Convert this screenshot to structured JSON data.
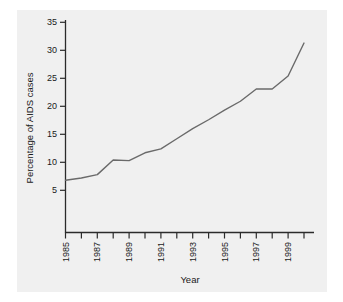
{
  "chart_data": {
    "type": "line",
    "title": "",
    "xlabel": "Year",
    "ylabel": "Percentage of AIDS cases",
    "x": [
      1985,
      1986,
      1987,
      1988,
      1989,
      1990,
      1991,
      1992,
      1993,
      1994,
      1995,
      1996,
      1997,
      1998,
      1999,
      2000
    ],
    "values": [
      6.8,
      7.2,
      7.8,
      10.4,
      10.3,
      11.7,
      12.4,
      14.2,
      16.0,
      17.6,
      19.3,
      20.9,
      23.1,
      23.1,
      25.4,
      31.3
    ],
    "series": [
      {
        "name": "Percentage of AIDS cases",
        "values": [
          6.8,
          7.2,
          7.8,
          10.4,
          10.3,
          11.7,
          12.4,
          14.2,
          16.0,
          17.6,
          19.3,
          20.9,
          23.1,
          23.1,
          25.4,
          31.3
        ]
      }
    ],
    "xlim": [
      1985,
      2000
    ],
    "ylim": [
      0,
      35
    ],
    "ytick_labels": [
      "5",
      "10",
      "15",
      "20",
      "25",
      "30",
      "35"
    ],
    "ytick_values": [
      5,
      10,
      15,
      20,
      25,
      30,
      35
    ],
    "xtick_values": [
      1985,
      1986,
      1987,
      1988,
      1989,
      1990,
      1991,
      1992,
      1993,
      1994,
      1995,
      1996,
      1997,
      1998,
      1999,
      2000
    ],
    "xtick_labels": [
      "1985",
      "",
      "1987",
      "",
      "1989",
      "",
      "1991",
      "",
      "1993",
      "",
      "1995",
      "",
      "1997",
      "",
      "1999",
      ""
    ],
    "grid": false,
    "legend": null,
    "line_color": "#6a6a6a",
    "axis_color": "#2b2b2b",
    "panel_color": "#f0f0f0",
    "figure_color": "#ffffff"
  }
}
